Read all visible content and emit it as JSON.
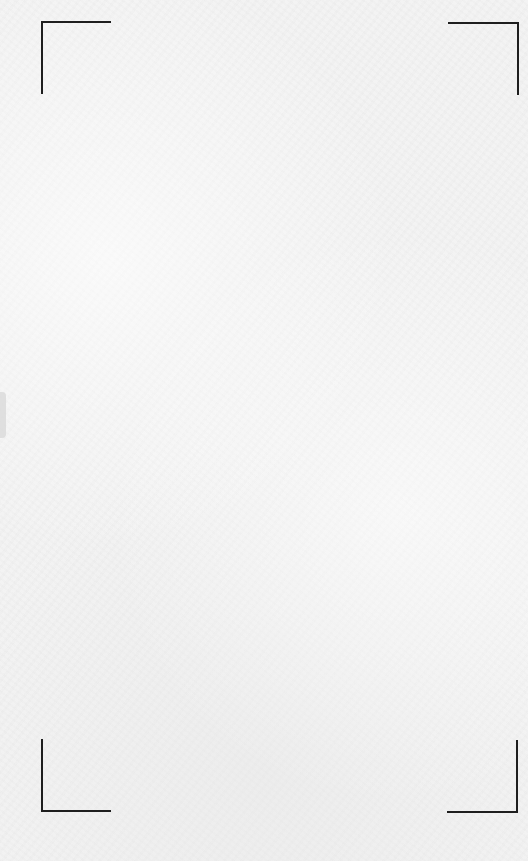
{
  "screen": {
    "type": "document-scanner-viewfinder",
    "background_color": "#f3f3f3",
    "frame_color": "#1e1e1e"
  },
  "frame": {
    "corners": [
      {
        "position": "top-left",
        "icon": "corner-bracket-top-left-icon"
      },
      {
        "position": "top-right",
        "icon": "corner-bracket-top-right-icon"
      },
      {
        "position": "bottom-left",
        "icon": "corner-bracket-bottom-left-icon"
      },
      {
        "position": "bottom-right",
        "icon": "corner-bracket-bottom-right-icon"
      }
    ]
  },
  "edge_handle": {
    "side": "left",
    "color": "#d9d9d9"
  }
}
